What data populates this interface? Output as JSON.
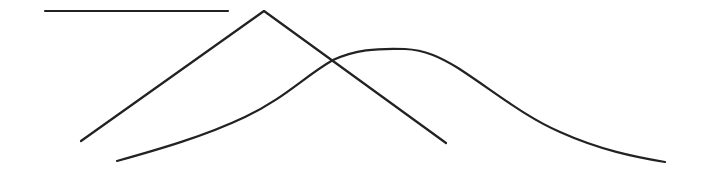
{
  "diagram": {
    "background_color": "#ffffff",
    "line_color": "#222222",
    "horizontal_line": {
      "x1": 45,
      "y1": 11,
      "x2": 228,
      "y2": 11,
      "width": 2.2
    },
    "triangle_peak": {
      "points": "81,141 264,11 446,143",
      "width": 2.2
    },
    "bell_curve": {
      "path": "M117,161 C160,149 205,136 245,117 C285,98 305,76 333,60 C355,50 375,48 405,49 C425,50 440,57 458,68 C495,92 525,117 560,132 C600,150 635,157 665,162",
      "width": 2.2
    }
  }
}
